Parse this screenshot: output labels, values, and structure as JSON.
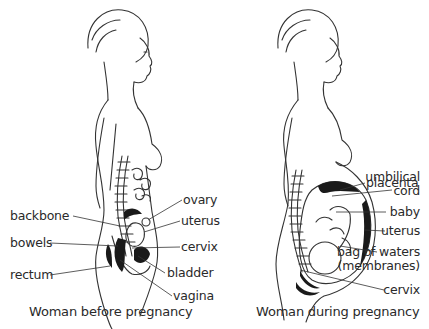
{
  "figures": [
    {
      "id": "before",
      "caption": "Woman before pregnancy",
      "labels": {
        "ovary": "ovary",
        "backbone": "backbone",
        "uterus": "uterus",
        "bowels": "bowels",
        "cervix": "cervix",
        "rectum": "rectum",
        "bladder": "bladder",
        "vagina": "vagina"
      }
    },
    {
      "id": "during",
      "caption": "Woman during pregnancy",
      "labels": {
        "placenta": "placenta",
        "umbilical_cord_1": "umbilical",
        "umbilical_cord_2": "cord",
        "baby": "baby",
        "uterus": "uterus",
        "bag_of_waters_1": "bag of waters",
        "bag_of_waters_2": "(membranes)",
        "cervix": "cervix"
      }
    }
  ],
  "style": {
    "line_color": "#333333",
    "fill_color": "#1a1a1a",
    "background": "#ffffff"
  }
}
